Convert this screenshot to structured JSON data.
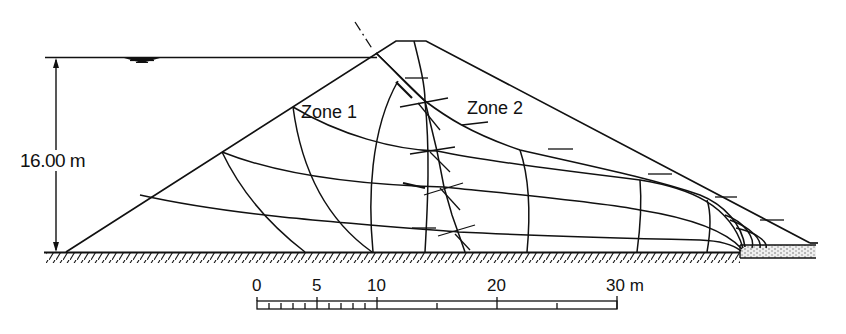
{
  "figure": {
    "type": "flow-net",
    "height_dimension": {
      "label": "16.00 m",
      "value": 16.0,
      "unit": "m"
    },
    "zones": [
      {
        "id": "zone-1",
        "label": "Zone 1"
      },
      {
        "id": "zone-2",
        "label": "Zone 2"
      }
    ],
    "water_level_symbol": "water-surface-triangle",
    "colors": {
      "line": "#111111",
      "background": "#ffffff",
      "drain_fill": "#d9d9d9"
    }
  },
  "scale_bar": {
    "unit": "m",
    "ticks": [
      {
        "value": 0,
        "label": "0"
      },
      {
        "value": 5,
        "label": "5"
      },
      {
        "value": 10,
        "label": "10"
      },
      {
        "value": 20,
        "label": "20"
      },
      {
        "value": 30,
        "label": "30 m"
      }
    ]
  }
}
